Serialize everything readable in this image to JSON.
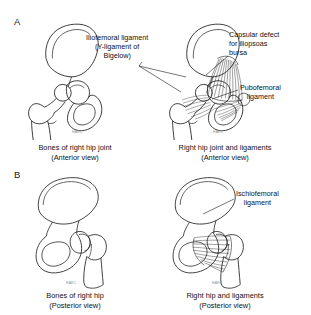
{
  "figure": {
    "background_color": "#ffffff",
    "ink_color": "#1a1a1a",
    "panels": [
      {
        "letter": "A",
        "view": "Anterior view",
        "illustrations": [
          {
            "caption_line1": "Bones of right hip joint",
            "caption_line2": "(Anterior view)"
          },
          {
            "caption_line1": "Right hip joint and ligaments",
            "caption_line2": "(Anterior view)"
          }
        ]
      },
      {
        "letter": "B",
        "view": "Posterior view",
        "illustrations": [
          {
            "caption_line1": "Bones of right hip",
            "caption_line2": "(Posterior view)"
          },
          {
            "caption_line1": "Right hip and ligaments",
            "caption_line2": "(Posterior view)"
          }
        ]
      }
    ]
  },
  "panel_a": {
    "letter": "A",
    "labels": {
      "iliofemoral": {
        "line1": "Iliofemoral ligament",
        "line2": "(Y-ligament of",
        "line3": "Bigelow)"
      },
      "capsular_defect": {
        "line1": "Capsular defect",
        "line2": "for iliopsoas",
        "line3": "bursa"
      },
      "pubofemoral": {
        "line1": "Pubofemoral",
        "line2": "ligament"
      }
    },
    "caption_left": {
      "line1": "Bones of right hip joint",
      "line2": "(Anterior view)"
    },
    "caption_right": {
      "line1": "Right hip joint and ligaments",
      "line2": "(Anterior view)"
    }
  },
  "panel_b": {
    "letter": "B",
    "labels": {
      "ischiofemoral": {
        "line1": "Ischiofemoral",
        "line2": "ligament"
      }
    },
    "caption_left": {
      "line1": "Bones of right hip",
      "line2": "(Posterior view)"
    },
    "caption_right": {
      "line1": "Right hip and ligaments",
      "line2": "(Posterior view)"
    }
  },
  "artist_signature": {
    "text": "HARC"
  }
}
